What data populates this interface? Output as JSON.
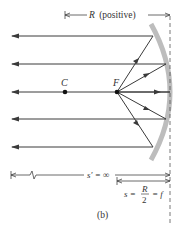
{
  "figure": {
    "caption": "(b)",
    "labels": {
      "radius": "R",
      "radius_note": "(positive)",
      "center": "C",
      "focal": "F",
      "image_distance": "s′ = ∞",
      "object_distance_prefix": "s =",
      "object_fraction_num": "R",
      "object_fraction_den": "2",
      "object_distance_suffix": "= f"
    },
    "colors": {
      "ray": "#3a3a3a",
      "mirror": "#bdbdbd",
      "text": "#333333"
    },
    "ray_count": 5
  }
}
